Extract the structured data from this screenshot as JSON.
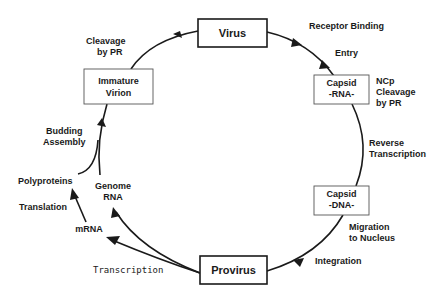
{
  "nodes": {
    "virus": "Virus",
    "capsid_rna": {
      "line1": "Capsid",
      "line2": "-RNA-"
    },
    "capsid_dna": {
      "line1": "Capsid",
      "line2": "-DNA-"
    },
    "provirus": "Provirus",
    "immature_virion": {
      "line1": "Immature",
      "line2": "Virion"
    },
    "genome_rna": {
      "line1": "Genome",
      "line2": "RNA"
    },
    "mrna": "mRNA",
    "polyproteins": "Polyproteins"
  },
  "edge_labels": {
    "receptor_binding": "Receptor Binding",
    "entry": "Entry",
    "ncp_cleavage": {
      "line1": "NCp",
      "line2": "Cleavage",
      "line3": "by PR"
    },
    "reverse_transcription": {
      "line1": "Reverse",
      "line2": "Transcription"
    },
    "migration": {
      "line1": "Migration",
      "line2": "to Nucleus"
    },
    "integration": "Integration",
    "transcription": "Transcription",
    "translation": "Translation",
    "budding_assembly": {
      "line1": "Budding",
      "line2": "Assembly"
    },
    "cleavage_by_pr": {
      "line1": "Cleavage",
      "line2": "by PR"
    }
  },
  "colors": {
    "ink": "#1a1a1a",
    "background": "#ffffff"
  }
}
